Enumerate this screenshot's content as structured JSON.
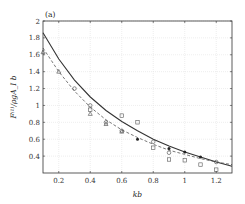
{
  "chart_data": {
    "type": "line",
    "panel_label": "(a)",
    "title": "",
    "xlabel": "kb",
    "ylabel": "F^(1)/ρgA_I b",
    "ylabel_display": "F⁽¹⁾/ρgA_I b",
    "xlim": [
      0.1,
      1.3
    ],
    "ylim": [
      0.2,
      2.0
    ],
    "x_ticks": [
      0.2,
      0.4,
      0.6,
      0.8,
      1.0,
      1.2
    ],
    "x_tick_labels": [
      "0.2",
      "0.4",
      "0.6",
      "0.8",
      "1",
      "1.2"
    ],
    "y_ticks": [
      0.4,
      0.6,
      0.8,
      1.0,
      1.2,
      1.4,
      1.6,
      1.8,
      2.0
    ],
    "y_tick_labels": [
      "0.4",
      "0.6",
      "0.8",
      "1",
      "1.2",
      "1.4",
      "1.6",
      "1.8",
      "2"
    ],
    "grid": true,
    "legend": null,
    "series": [
      {
        "name": "theory-solid",
        "style": "solid",
        "color": "#333333",
        "x": [
          0.1,
          0.2,
          0.3,
          0.4,
          0.5,
          0.6,
          0.7,
          0.8,
          0.9,
          1.0,
          1.1,
          1.2,
          1.3
        ],
        "y": [
          1.86,
          1.55,
          1.3,
          1.1,
          0.94,
          0.81,
          0.7,
          0.6,
          0.52,
          0.45,
          0.39,
          0.33,
          0.28
        ]
      },
      {
        "name": "theory-dashed",
        "style": "dashed",
        "color": "#555555",
        "x": [
          0.1,
          0.2,
          0.3,
          0.4,
          0.5,
          0.6,
          0.7,
          0.8,
          0.9,
          1.0,
          1.1,
          1.2,
          1.3
        ],
        "y": [
          1.68,
          1.4,
          1.17,
          0.98,
          0.83,
          0.71,
          0.62,
          0.54,
          0.47,
          0.42,
          0.37,
          0.33,
          0.3
        ]
      },
      {
        "name": "experiment-triangles",
        "marker": "triangle-open",
        "color": "#444444",
        "x": [
          0.1,
          0.2,
          0.4,
          0.5,
          0.6
        ],
        "y": [
          1.63,
          1.4,
          0.9,
          0.78,
          0.69
        ]
      },
      {
        "name": "experiment-circles",
        "marker": "circle-open",
        "color": "#444444",
        "x": [
          0.3,
          0.4,
          0.5,
          0.6,
          0.8,
          0.9,
          1.2
        ],
        "y": [
          1.2,
          1.0,
          0.8,
          0.7,
          0.57,
          0.44,
          0.33
        ]
      },
      {
        "name": "experiment-filled",
        "marker": "circle-filled",
        "color": "#222222",
        "x": [
          0.7,
          0.9,
          1.0,
          1.1
        ],
        "y": [
          0.6,
          0.49,
          0.45,
          0.39
        ]
      },
      {
        "name": "experiment-squares",
        "marker": "square-open",
        "color": "#555555",
        "x": [
          0.4,
          0.6,
          0.7,
          0.8,
          0.9,
          1.0,
          1.1,
          1.2
        ],
        "y": [
          0.95,
          0.88,
          0.8,
          0.5,
          0.36,
          0.35,
          0.3,
          0.24
        ]
      }
    ]
  }
}
